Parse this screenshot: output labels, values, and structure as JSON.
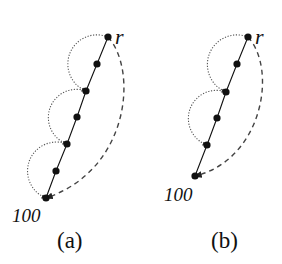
{
  "figure": {
    "panels": [
      {
        "id": "a",
        "caption": "(a)",
        "root_label": "r",
        "end_label": "100",
        "nodes": [
          [
            108,
            37
          ],
          [
            97,
            64
          ],
          [
            86,
            91
          ],
          [
            77,
            117
          ],
          [
            67,
            144
          ],
          [
            56,
            171
          ],
          [
            46,
            198
          ]
        ],
        "dotted_arcs": [
          [
            0,
            2
          ],
          [
            2,
            4
          ],
          [
            4,
            6
          ]
        ],
        "dashed_curve": {
          "from": 0,
          "to": 6,
          "control1": [
            138,
            70
          ],
          "control2": [
            130,
            170
          ]
        },
        "label_positions": {
          "root": [
            115,
            26
          ],
          "end": [
            12,
            206
          ],
          "caption": [
            57,
            229
          ]
        }
      },
      {
        "id": "b",
        "caption": "(b)",
        "root_label": "r",
        "end_label": "100",
        "nodes": [
          [
            248,
            37
          ],
          [
            237,
            64
          ],
          [
            226,
            92
          ],
          [
            217,
            118
          ],
          [
            207,
            145
          ],
          [
            195,
            176
          ]
        ],
        "dotted_arcs": [
          [
            0,
            2
          ],
          [
            2,
            4
          ]
        ],
        "dashed_curve": {
          "from": 0,
          "to": 5,
          "control1": [
            278,
            70
          ],
          "control2": [
            262,
            160
          ]
        },
        "label_positions": {
          "root": [
            255,
            26
          ],
          "end": [
            164,
            185
          ],
          "caption": [
            211,
            229
          ]
        }
      }
    ],
    "colors": {
      "ink": "#111111",
      "dotted": "#555555",
      "dashed": "#444444",
      "background": "#ffffff"
    }
  }
}
